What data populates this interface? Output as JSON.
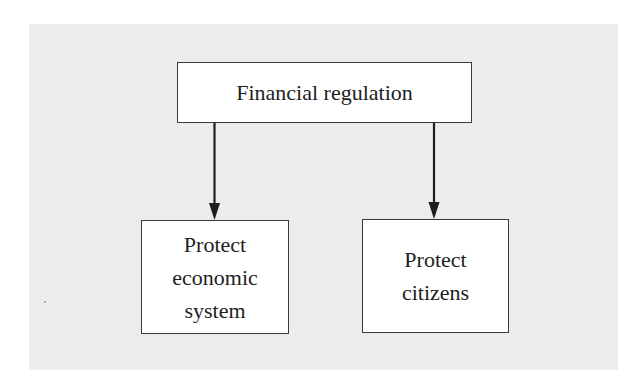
{
  "diagram": {
    "type": "tree",
    "colors": {
      "background": "#ffffff",
      "panel": "#ececec",
      "node_fill": "#ffffff",
      "node_border": "#3a3a3a",
      "arrow": "#1e1e1e",
      "text": "#1e1e1e"
    },
    "root": {
      "id": "financial-regulation",
      "label": "Financial regulation"
    },
    "children": [
      {
        "id": "protect-economic-system",
        "label": "Protect economic system",
        "lines": [
          "Protect",
          "economic",
          "system"
        ]
      },
      {
        "id": "protect-citizens",
        "label": "Protect citizens",
        "lines": [
          "Protect",
          "citizens"
        ]
      }
    ],
    "edges": [
      {
        "from": "financial-regulation",
        "to": "protect-economic-system"
      },
      {
        "from": "financial-regulation",
        "to": "protect-citizens"
      }
    ]
  }
}
